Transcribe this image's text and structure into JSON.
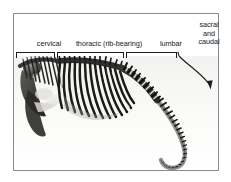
{
  "figure": {
    "kind": "anatomical-diagram",
    "frame_color": "#8a8a8a",
    "background_color": "#ffffff",
    "ink_color": "#1a1a1a"
  },
  "labels": {
    "cervical": "cervical",
    "thoracic": "thoracic (rib-bearing)",
    "lumbar": "lumbar",
    "sacral_line1": "sacral",
    "sacral_line2": "and",
    "sacral_line3": "caudal"
  },
  "brackets": [
    {
      "name": "cervical-bracket",
      "label": "cervical"
    },
    {
      "name": "thoracic-bracket",
      "label": "thoracic (rib-bearing)"
    },
    {
      "name": "lumbar-bracket",
      "label": "lumbar"
    }
  ],
  "arrow": {
    "name": "sacral-caudal-arrow",
    "points_to": "tail",
    "style": "curved-with-arrowhead"
  },
  "specimen": {
    "name": "skeleton-photograph",
    "regions": [
      "skull",
      "cervical vertebrae",
      "ribs",
      "lumbar vertebrae",
      "caudal vertebrae"
    ]
  }
}
